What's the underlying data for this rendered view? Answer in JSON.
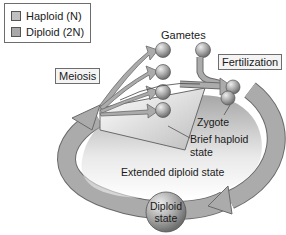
{
  "legend": {
    "items": [
      {
        "label": "Haploid (N)",
        "color": "#c0c0c0"
      },
      {
        "label": "Diploid (2N)",
        "color": "#a8a8a8"
      }
    ]
  },
  "labels": {
    "gametes": "Gametes",
    "meiosis": "Meiosis",
    "fertilization": "Fertilization",
    "zygote": "Zygote",
    "brief_haploid_line1": "Brief haploid",
    "brief_haploid_line2": "state",
    "extended_diploid": "Extended diploid state",
    "diploid_state_line1": "Diploid",
    "diploid_state_line2": "state"
  },
  "colors": {
    "loop_fill": "#a9a9a9",
    "loop_stroke": "#6a6a6a",
    "sphere_light": "#e6e6e6",
    "sphere_dark": "#7a7a7a"
  }
}
